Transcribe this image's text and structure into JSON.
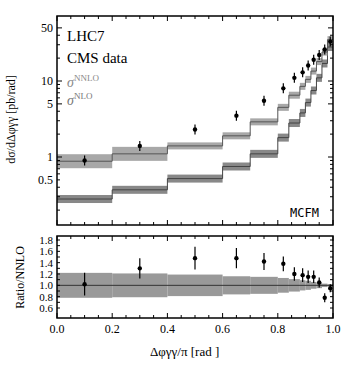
{
  "chart_data": [
    {
      "type": "line",
      "title": "",
      "xlabel": "",
      "ylabel": "dσ/dΔφγγ [pb/rad]",
      "yscale": "log",
      "ylim": [
        0.15,
        60
      ],
      "xlim": [
        0.0,
        1.0
      ],
      "y_ticks": [
        "50",
        "10",
        "5",
        "1",
        "0.5"
      ],
      "annotations": [
        "LHC7",
        "CMS data",
        "MCFM"
      ],
      "legend": [
        {
          "label": "σ^NNLO",
          "style": "light band"
        },
        {
          "label": "σ^NLO",
          "style": "dark band"
        }
      ],
      "bin_edges": [
        0.0,
        0.2,
        0.4,
        0.6,
        0.7,
        0.8,
        0.84,
        0.88,
        0.9,
        0.92,
        0.94,
        0.96,
        0.98,
        1.0
      ],
      "series": [
        {
          "name": "CMS data",
          "x": [
            0.1,
            0.3,
            0.5,
            0.65,
            0.75,
            0.82,
            0.86,
            0.89,
            0.91,
            0.93,
            0.95,
            0.97,
            0.99
          ],
          "values": [
            0.9,
            1.4,
            2.3,
            3.5,
            5.5,
            8.0,
            11.0,
            13.0,
            16.0,
            19.0,
            22.0,
            26.0,
            33.0
          ]
        },
        {
          "name": "σ^NNLO",
          "values": [
            0.88,
            1.1,
            1.4,
            1.9,
            2.9,
            4.5,
            6.5,
            8.5,
            10.5,
            13.5,
            18.0,
            24.0,
            35.0
          ]
        },
        {
          "name": "σ^NLO",
          "values": [
            0.28,
            0.37,
            0.52,
            0.75,
            1.1,
            1.8,
            2.8,
            3.8,
            5.2,
            7.5,
            11.0,
            17.0,
            28.0
          ]
        }
      ]
    },
    {
      "type": "scatter",
      "xlabel": "Δφγγ/π [rad]",
      "ylabel": "Ratio/NNLO",
      "ylim": [
        0.5,
        1.8
      ],
      "y_ticks": [
        "1.8",
        "1.6",
        "1.4",
        "1.2",
        "1.0",
        "0.8",
        "0.6"
      ],
      "x_ticks": [
        "0.0",
        "0.2",
        "0.4",
        "0.6",
        "0.8",
        "1.0"
      ],
      "series": [
        {
          "name": "Data/NNLO",
          "x": [
            0.1,
            0.3,
            0.5,
            0.65,
            0.75,
            0.82,
            0.86,
            0.89,
            0.91,
            0.93,
            0.95,
            0.97,
            0.99
          ],
          "values": [
            1.02,
            1.3,
            1.48,
            1.48,
            1.42,
            1.38,
            1.2,
            1.18,
            1.15,
            1.15,
            1.05,
            0.78,
            0.95
          ],
          "errors": [
            0.2,
            0.18,
            0.2,
            0.18,
            0.15,
            0.13,
            0.12,
            0.12,
            0.11,
            0.11,
            0.09,
            0.08,
            0.07
          ]
        },
        {
          "name": "NNLO band",
          "bin_edges": [
            0.0,
            0.2,
            0.4,
            0.6,
            0.7,
            0.8,
            0.84,
            0.88,
            0.9,
            0.92,
            0.94,
            0.96,
            0.98,
            1.0
          ],
          "half_width": [
            0.22,
            0.21,
            0.19,
            0.16,
            0.15,
            0.13,
            0.11,
            0.09,
            0.08,
            0.06,
            0.05,
            0.03,
            0.02
          ]
        }
      ]
    }
  ],
  "labels": {
    "lhc": "LHC7",
    "cms": "CMS data",
    "nnlo": "σ",
    "nnlo_sup": "NNLO",
    "nlo": "σ",
    "nlo_sup": "NLO",
    "mcfm": "MCFM",
    "ylabel_top": "dσ/dΔφγγ [pb/rad]",
    "ylabel_bottom": "Ratio/NNLO",
    "xlabel": "Δφγγ/π [rad ]"
  }
}
